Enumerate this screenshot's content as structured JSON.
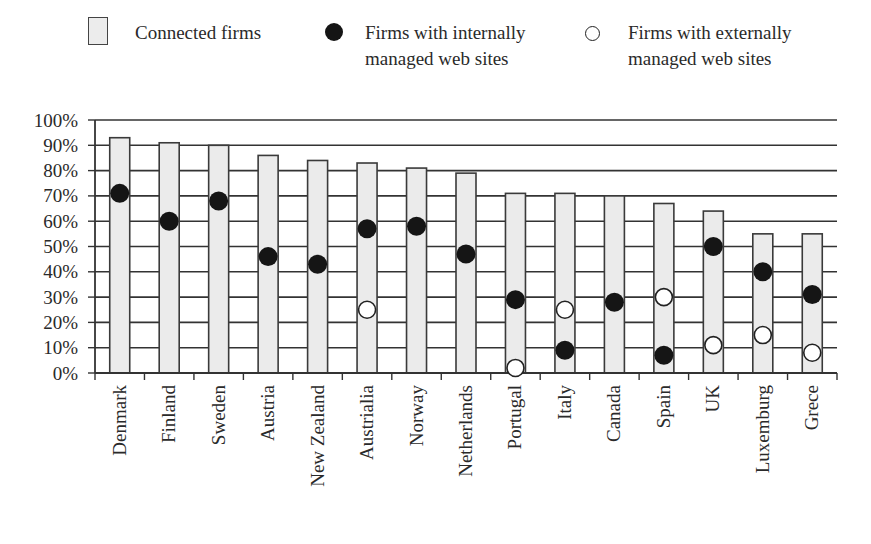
{
  "legend": {
    "connected": "Connected firms",
    "internal_line1": "Firms with internally",
    "internal_line2": "managed web sites",
    "external_line1": "Firms with externally",
    "external_line2": "managed web sites"
  },
  "colors": {
    "bar_fill": "#ebebeb",
    "bar_stroke": "#3a3a3a",
    "grid": "#333333",
    "dot_filled": "#151515",
    "dot_open_fill": "#ffffff",
    "dot_open_stroke": "#222222"
  },
  "chart_data": {
    "type": "bar",
    "title": "",
    "xlabel": "",
    "ylabel": "",
    "ylim": [
      0,
      100
    ],
    "yticks": [
      "0%",
      "10%",
      "20%",
      "30%",
      "40%",
      "50%",
      "60%",
      "70%",
      "80%",
      "90%",
      "100%"
    ],
    "grid": true,
    "legend_position": "top",
    "categories": [
      "Denmark",
      "Finland",
      "Sweden",
      "Austria",
      "New Zealand",
      "Austrialia",
      "Norway",
      "Netherlands",
      "Portugal",
      "Italy",
      "Canada",
      "Spain",
      "UK",
      "Luxemburg",
      "Grece"
    ],
    "series": [
      {
        "name": "Connected firms",
        "kind": "bar",
        "values": [
          93,
          91,
          90,
          86,
          84,
          83,
          81,
          79,
          71,
          71,
          70,
          67,
          64,
          55,
          55
        ]
      },
      {
        "name": "Firms with internally managed web sites",
        "kind": "marker-filled",
        "values": [
          71,
          60,
          68,
          46,
          43,
          57,
          58,
          47,
          29,
          9,
          28,
          7,
          50,
          40,
          31
        ]
      },
      {
        "name": "Firms with externally managed web sites",
        "kind": "marker-open",
        "values": [
          null,
          null,
          null,
          null,
          null,
          25,
          null,
          null,
          2,
          25,
          null,
          30,
          11,
          15,
          8
        ]
      }
    ]
  }
}
